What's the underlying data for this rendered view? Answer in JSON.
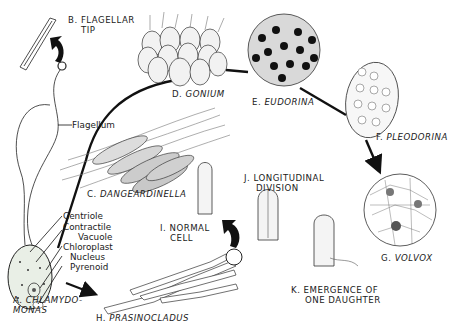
{
  "figure": {
    "panels": [
      {
        "id": "A",
        "letter": "A.",
        "name": "CHLAMYDO-",
        "name2": "MONAS"
      },
      {
        "id": "B",
        "letter": "B.",
        "name": "FLAGELLAR",
        "name2": "TIP"
      },
      {
        "id": "C",
        "letter": "C.",
        "name": "DANGEARDINELLA"
      },
      {
        "id": "D",
        "letter": "D.",
        "name": "GONIUM"
      },
      {
        "id": "E",
        "letter": "E.",
        "name": "EUDORINA"
      },
      {
        "id": "F",
        "letter": "F.",
        "name": "PLEODORINA"
      },
      {
        "id": "G",
        "letter": "G.",
        "name": "VOLVOX"
      },
      {
        "id": "H",
        "letter": "H.",
        "name": "PRASINOCLADUS"
      },
      {
        "id": "I",
        "letter": "I.",
        "name": "NORMAL",
        "name2": "CELL"
      },
      {
        "id": "J",
        "letter": "J.",
        "name": "LONGITUDINAL",
        "name2": "DIVISION"
      },
      {
        "id": "K",
        "letter": "K.",
        "name": "EMERGENCE OF",
        "name2": "ONE DAUGHTER"
      }
    ],
    "chlamydomonas_parts": [
      "Flagellum",
      "Centriole",
      "Contractile",
      "Vacuole",
      "Chloroplast",
      "Nucleus",
      "Pyrenoid"
    ]
  }
}
